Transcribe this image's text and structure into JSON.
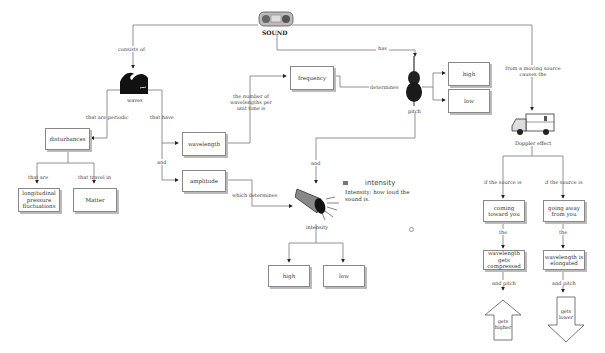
{
  "root": {
    "title": "SOUND",
    "icon": "radio-icon"
  },
  "links": {
    "consists_of": "consists of",
    "has": "has",
    "that_are_periodic": "that are periodic",
    "that_have": "that have",
    "and_1": "and",
    "that_are": "that are",
    "that_travel_in": "that travel in",
    "wavelengths_per_time": "the number of wavelengths per unit time is",
    "determines": "determines",
    "which_determines": "which determines",
    "and_pitch": "and",
    "from_moving_source": "from a moving source causes the",
    "if_source_left": "if the source is",
    "if_source_right": "if the source is",
    "the_left": "the",
    "the_right": "the",
    "and_pitch_left": "and pitch",
    "and_pitch_right": "and pitch"
  },
  "nodes": {
    "waves": {
      "label": "waves",
      "icon": "wave-icon"
    },
    "disturbances": "disturbances",
    "longitudinal": "longitudinal pressure fluctuations",
    "matter": "Matter",
    "wavelength": "wavelength",
    "amplitude": "amplitude",
    "frequency": "frequency",
    "pitch": {
      "label": "pitch",
      "icon": "cello-icon"
    },
    "pitch_high": "high",
    "pitch_low": "low",
    "intensity": {
      "label": "intensity",
      "icon": "megaphone-icon"
    },
    "intensity_high": "high",
    "intensity_low": "low",
    "doppler": {
      "label": "Doppler effect",
      "icon": "ambulance-icon"
    },
    "coming_toward": "coming toward you",
    "going_away": "going away from you",
    "compressed": "wavelength gets compressed",
    "elongated": "wavelength is elongated",
    "gets_higher": "gets higher",
    "gets_lower": "gets lower"
  },
  "note": {
    "title": "intensity",
    "body": "Intensity: how loud the sound is.",
    "icon": "note-icon"
  }
}
